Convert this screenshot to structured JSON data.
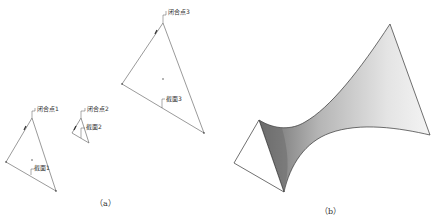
{
  "panel_a": {
    "caption": "（a）",
    "triangles": [
      {
        "closure_point_label": "闭合点1",
        "section_label": "截面1",
        "vertices": [
          [
            32,
            118
          ],
          [
            6,
            162
          ],
          [
            56,
            191
          ]
        ],
        "center": [
          32,
          160
        ]
      },
      {
        "closure_point_label": "闭合点2",
        "section_label": "截面2",
        "vertices": [
          [
            81,
            118
          ],
          [
            72,
            133
          ],
          [
            89,
            143
          ]
        ],
        "center": [
          81,
          134
        ]
      },
      {
        "closure_point_label": "闭合点3",
        "section_label": "截面3",
        "vertices": [
          [
            163,
            23
          ],
          [
            122,
            84
          ],
          [
            204,
            133
          ]
        ],
        "center": [
          163,
          79
        ]
      }
    ]
  },
  "panel_b": {
    "caption": "（b）",
    "description": "Lofted surface through three triangular sections",
    "colors": {
      "surface_dark": "#6e6e6e",
      "surface_light": "#f2f2f2",
      "edge": "#333333"
    }
  }
}
